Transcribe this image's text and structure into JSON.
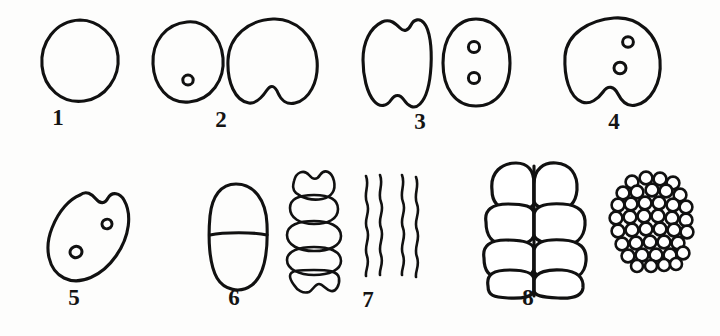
{
  "plate": {
    "title": "Cell cleavage stages",
    "background_color": "#fdfdfc",
    "ink_color": "#111111",
    "figure_count": 8
  },
  "figures": [
    {
      "number": "1",
      "label": "1",
      "caption": "single undivided cell",
      "drawings": [
        "plain-round-cell"
      ],
      "nuclei": 0,
      "notches": 0
    },
    {
      "number": "2",
      "label": "2",
      "caption": "cell with single nucleus and cell beginning to cleave",
      "drawings": [
        "round-cell-one-nucleus",
        "cell-with-bottom-notch"
      ],
      "nuclei": 1,
      "notches": 1
    },
    {
      "number": "3",
      "label": "3",
      "caption": "constricted cell and oval cell with two nuclei",
      "drawings": [
        "cell-notched-top-and-bottom",
        "oval-cell-two-nuclei"
      ],
      "nuclei": 2,
      "notches": 2
    },
    {
      "number": "4",
      "label": "4",
      "caption": "cell with two nuclei and cleavage furrow",
      "drawings": [
        "round-cell-two-nuclei-bottom-notch"
      ],
      "nuclei": 2,
      "notches": 1
    },
    {
      "number": "5",
      "label": "5",
      "caption": "tilted oval cell with two nuclei and top notch",
      "drawings": [
        "tilted-oval-two-nuclei-top-notch"
      ],
      "nuclei": 2,
      "notches": 1
    },
    {
      "number": "6",
      "label": "6",
      "caption": "two-celled stage divided by transverse septum",
      "drawings": [
        "two-cell-capsule"
      ],
      "cells": 2
    },
    {
      "number": "7",
      "label": "7",
      "caption": "five-segment chain and wavy filaments",
      "drawings": [
        "five-segment-chain",
        "wavy-filaments"
      ],
      "segments": 5,
      "filaments": 4
    },
    {
      "number": "8",
      "label": "8",
      "caption": "eight-cell stage and many-celled morula",
      "drawings": [
        "eight-cell-block",
        "morula-cluster"
      ],
      "block_cells": 8,
      "morula_cells": 41
    }
  ]
}
